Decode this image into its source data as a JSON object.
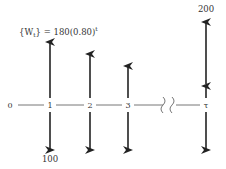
{
  "diagram": {
    "title_formula": {
      "lhs": "{W",
      "sub": "t",
      "mid": "} = 180(0.80)",
      "sup": "t"
    },
    "axis_labels": [
      "0",
      "1",
      "2",
      "3",
      "τ"
    ],
    "top_value": "200",
    "bottom_value": "100",
    "colors": {
      "line": "#222222",
      "text": "#333333",
      "axis": "#666666"
    }
  }
}
